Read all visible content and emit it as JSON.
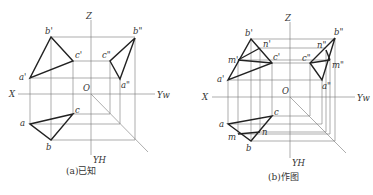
{
  "figures": [
    {
      "caption": "(a)已知",
      "axes": {
        "Z": "Z",
        "X": "X",
        "O": "O",
        "YW": "Yw",
        "YH": "YH"
      },
      "points": {
        "a1": "a'",
        "b1": "b'",
        "c1": "c'",
        "a2": "a\"",
        "b2": "b\"",
        "c2": "c\"",
        "a": "a",
        "b": "b",
        "c": "c"
      }
    },
    {
      "caption": "(b)作图",
      "axes": {
        "Z": "Z",
        "X": "X",
        "O": "O",
        "YW": "Yw",
        "YH": "YH"
      },
      "points": {
        "a1": "a'",
        "b1": "b'",
        "c1": "c'",
        "m1": "m'",
        "n1": "n'",
        "a2": "a\"",
        "b2": "b\"",
        "c2": "c\"",
        "m2": "m\"",
        "n2": "n\"",
        "a": "a",
        "b": "b",
        "c": "c",
        "m": "m",
        "n": "n"
      }
    }
  ]
}
